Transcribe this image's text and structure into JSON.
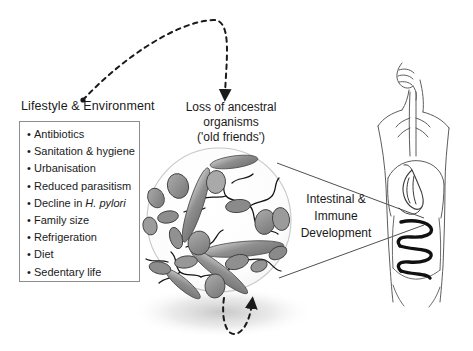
{
  "figure": {
    "background_color": "#ffffff"
  },
  "lifestyle": {
    "heading": "Lifestyle & Environment",
    "bullet_char": "•",
    "items": [
      {
        "text": "Antibiotics",
        "italic": ""
      },
      {
        "text": "Sanitation & hygiene",
        "italic": ""
      },
      {
        "text": "Urbanisation",
        "italic": ""
      },
      {
        "text": "Reduced parasitism",
        "italic": ""
      },
      {
        "text": "Decline in ",
        "italic": "H. pylori"
      },
      {
        "text": "Family size",
        "italic": ""
      },
      {
        "text": "Refrigeration",
        "italic": ""
      },
      {
        "text": "Diet",
        "italic": ""
      },
      {
        "text": "Sedentary life",
        "italic": ""
      }
    ]
  },
  "loss": {
    "line1": "Loss of ancestral organisms",
    "line2": "('old friends')"
  },
  "outcome": {
    "line1": "Intestinal &",
    "line2": "Immune",
    "line3": "Development"
  },
  "colors": {
    "text": "#1a1a1a",
    "box_border": "#8d8d8d",
    "circle_outline": "#c9c9c9",
    "microbe_fill": "#8a8a8a",
    "microbe_fill_light": "#a8a8a8",
    "microbe_outline": "#3a3a3a",
    "filament": "#141414",
    "body_outline": "#5a5a5a",
    "intestine": "#111111",
    "arrow_dashed": "#1a1a1a",
    "shadow": "#bdbdbd"
  },
  "graphics": {
    "dashed_arc_top": "curved dashed arrow from lifestyle panel to loss heading",
    "dashed_arrow_bottom": "u-shaped dashed arrow below microbe circle",
    "funnel": "two straight lines from microbe circle to intestine",
    "microbe_circle": "circle of gut microbiota",
    "human_figure": "torso with airway, stomach and coiled intestine"
  }
}
